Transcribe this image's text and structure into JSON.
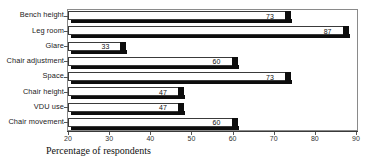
{
  "chart_data": {
    "type": "bar",
    "orientation": "horizontal",
    "title": "",
    "xlabel": "Percentage of respondents",
    "ylabel": "",
    "categories": [
      "Bench height",
      "Leg room",
      "Glare",
      "Chair adjustment",
      "Space",
      "Chair height",
      "VDU use",
      "Chair movement"
    ],
    "values": [
      73,
      87,
      33,
      60,
      73,
      47,
      47,
      60
    ],
    "data_labels": [
      "73",
      "87",
      "33",
      "60",
      "73",
      "47",
      "47",
      "60"
    ],
    "xlim": [
      20,
      90
    ],
    "xticks": [
      20,
      30,
      40,
      50,
      60,
      70,
      80,
      90
    ],
    "xtick_labels": [
      "20",
      "30",
      "40",
      "50",
      "60",
      "70",
      "80",
      "90"
    ],
    "grid": false,
    "legend": null,
    "style": {
      "bar_face_color": "#ffffff",
      "bar_outline_color": "#3a3a3a",
      "bar_shadow_color": "#0d0d0d",
      "frame_color": "#8a8a8a",
      "text_color": "#111111"
    }
  },
  "title_sliver": "",
  "axis": {
    "x_title": "Percentage of respondents"
  }
}
